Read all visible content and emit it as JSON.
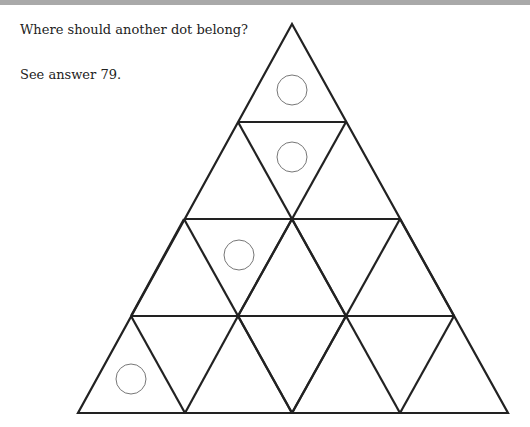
{
  "header": {
    "bar_color": "#a9a9a9"
  },
  "puzzle": {
    "question": "Where should another dot belong?",
    "answer_ref": "See answer 79.",
    "figure": {
      "shape": "large triangle subdivided into 16 small triangles (4 rows)",
      "dots": [
        {
          "row": 1,
          "position": "top triangle"
        },
        {
          "row": 2,
          "position": "middle inverted triangle"
        },
        {
          "row": 3,
          "position": "first inverted triangle"
        },
        {
          "row": 4,
          "position": "leftmost upright triangle"
        }
      ]
    }
  }
}
